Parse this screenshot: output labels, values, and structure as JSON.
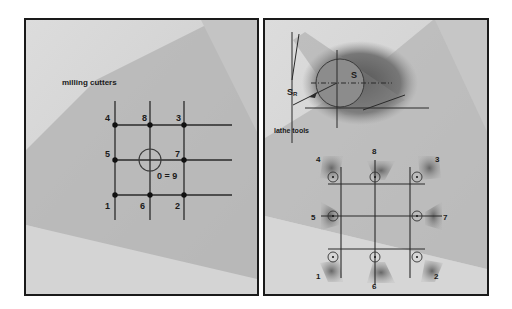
{
  "left_panel": {
    "title": "milling cutters",
    "points": [
      {
        "label": "1",
        "x": 113,
        "y": 193,
        "lx": 104,
        "ly": 208
      },
      {
        "label": "2",
        "x": 182,
        "y": 193,
        "lx": 174,
        "ly": 208
      },
      {
        "label": "3",
        "x": 182,
        "y": 123,
        "lx": 173,
        "ly": 119
      },
      {
        "label": "4",
        "x": 113,
        "y": 123,
        "lx": 103,
        "ly": 119
      },
      {
        "label": "5",
        "x": 113,
        "y": 158,
        "lx": 103,
        "ly": 155
      },
      {
        "label": "6",
        "x": 148,
        "y": 193,
        "lx": 139,
        "ly": 208
      },
      {
        "label": "7",
        "x": 182,
        "y": 158,
        "lx": 172,
        "ly": 155
      },
      {
        "label": "8",
        "x": 148,
        "y": 123,
        "lx": 139,
        "ly": 119
      }
    ],
    "center_label": "0 = 9"
  },
  "right_panel": {
    "title": "lathe tools",
    "radius_label": "S",
    "radius_sub": "R",
    "center_label": "S",
    "points": [
      {
        "label": "1",
        "x": 337,
        "y": 256,
        "lx": 317,
        "ly": 277
      },
      {
        "label": "2",
        "x": 420,
        "y": 256,
        "lx": 435,
        "ly": 277
      },
      {
        "label": "3",
        "x": 420,
        "y": 173,
        "lx": 437,
        "ly": 162
      },
      {
        "label": "4",
        "x": 337,
        "y": 173,
        "lx": 316,
        "ly": 162
      },
      {
        "label": "5",
        "x": 337,
        "y": 216,
        "lx": 313,
        "ly": 221
      },
      {
        "label": "6",
        "x": 378,
        "y": 256,
        "lx": 374,
        "ly": 287
      },
      {
        "label": "7",
        "x": 420,
        "y": 216,
        "lx": 441,
        "ly": 221
      },
      {
        "label": "8",
        "x": 378,
        "y": 173,
        "lx": 374,
        "ly": 155
      }
    ]
  },
  "colors": {
    "line": "#2a2a2a",
    "bg_light": "#d8d8d8",
    "bg_mid": "#b4b4b4",
    "tool_shade": "#6a6a6a"
  }
}
